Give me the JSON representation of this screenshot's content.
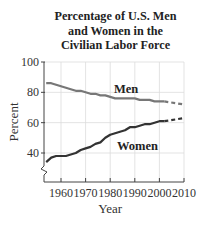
{
  "title_lines": [
    "Percentage of U.S. Men",
    "and Women in the",
    "Civilian Labor Force"
  ],
  "chart_data": {
    "type": "line",
    "title": "Percentage of U.S. Men and Women in the Civilian Labor Force",
    "xlabel": "Year",
    "ylabel": "Percent",
    "xlim": [
      1954,
      2010
    ],
    "ylim": [
      35,
      100
    ],
    "axis_break": true,
    "grid": true,
    "xticks": [
      "1960",
      "1970",
      "1980",
      "1990",
      "2000",
      "2010"
    ],
    "yticks": [
      "40",
      "60",
      "80",
      "100"
    ],
    "series": [
      {
        "name": "Men",
        "color": "#777777",
        "x": [
          1954,
          1956,
          1958,
          1960,
          1962,
          1964,
          1966,
          1968,
          1970,
          1972,
          1974,
          1976,
          1978,
          1980,
          1982,
          1984,
          1986,
          1988,
          1990,
          1992,
          1994,
          1996,
          1998,
          2000,
          2002
        ],
        "values": [
          86,
          86,
          85,
          84,
          83,
          82,
          81,
          81,
          80,
          79,
          79,
          78,
          78,
          77,
          76,
          76,
          76,
          76,
          76,
          75,
          75,
          75,
          74,
          74,
          74
        ],
        "projection": {
          "x": [
            2002,
            2010
          ],
          "values": [
            74,
            72
          ]
        }
      },
      {
        "name": "Women",
        "color": "#333333",
        "x": [
          1954,
          1956,
          1958,
          1960,
          1962,
          1964,
          1966,
          1968,
          1970,
          1972,
          1974,
          1976,
          1978,
          1980,
          1982,
          1984,
          1986,
          1988,
          1990,
          1992,
          1994,
          1996,
          1998,
          2000,
          2002
        ],
        "values": [
          34,
          37,
          38,
          38,
          38,
          39,
          40,
          42,
          43,
          44,
          46,
          47,
          50,
          52,
          53,
          54,
          55,
          57,
          57,
          58,
          59,
          59,
          60,
          61,
          61
        ],
        "projection": {
          "x": [
            2002,
            2010
          ],
          "values": [
            61,
            63
          ]
        }
      }
    ]
  }
}
